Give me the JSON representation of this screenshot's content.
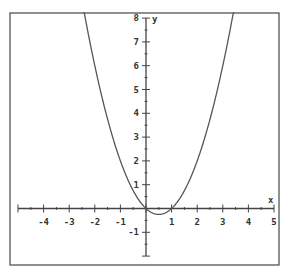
{
  "chart_data": {
    "type": "line",
    "title": "",
    "function": "y = x^2 - x",
    "xlabel": "x",
    "ylabel": "y",
    "xlim": [
      -5,
      5
    ],
    "ylim": [
      -2,
      8
    ],
    "grid": false,
    "legend": null,
    "x_ticks": [
      -4,
      -3,
      -2,
      -1,
      1,
      2,
      3,
      4,
      5
    ],
    "y_ticks": [
      -1,
      1,
      2,
      3,
      4,
      5,
      6,
      7,
      8
    ],
    "x_tick_labels": [
      "-4",
      "-3",
      "-2",
      "-1",
      "1",
      "2",
      "3",
      "4",
      "5"
    ],
    "y_tick_labels": [
      "-1",
      "1",
      "2",
      "3",
      "4",
      "5",
      "6",
      "7",
      "8"
    ],
    "minor_ticks_per_unit": 2,
    "series": [
      {
        "name": "parabola",
        "x": [
          -2.4,
          -2,
          -1.5,
          -1,
          -0.5,
          0,
          0.25,
          0.5,
          0.75,
          1,
          1.5,
          2,
          2.5,
          3,
          3.4
        ],
        "y": [
          8.16,
          6,
          3.75,
          2,
          0.75,
          0,
          -0.1875,
          -0.25,
          -0.1875,
          0,
          0.75,
          2,
          3.75,
          6,
          8.16
        ]
      }
    ],
    "key_points": {
      "roots": [
        0,
        1
      ],
      "vertex": [
        0.5,
        -0.25
      ]
    },
    "colors": {
      "frame": "#555555",
      "axes": "#444444",
      "curve": "#555555"
    }
  }
}
